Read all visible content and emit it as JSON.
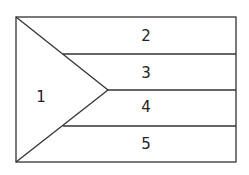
{
  "diagram": {
    "type": "flag-region-map",
    "stroke_color": "#333333",
    "regions": [
      {
        "id": "1",
        "label": "1",
        "shape": "triangle",
        "x": 41,
        "y": 96
      },
      {
        "id": "2",
        "label": "2",
        "shape": "stripe",
        "x": 146,
        "y": 40
      },
      {
        "id": "3",
        "label": "3",
        "shape": "stripe",
        "x": 146,
        "y": 77
      },
      {
        "id": "4",
        "label": "4",
        "shape": "stripe",
        "x": 146,
        "y": 111
      },
      {
        "id": "5",
        "label": "5",
        "shape": "stripe",
        "x": 146,
        "y": 148
      }
    ]
  }
}
